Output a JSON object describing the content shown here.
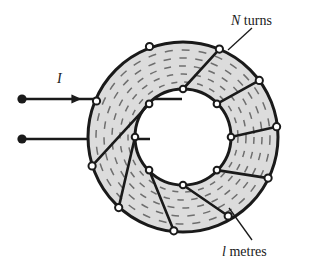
{
  "figure": {
    "type": "toroid-coil-diagram",
    "background_color": "#ffffff",
    "ink_color": "#1a1a1a",
    "core_fill_color": "#dcdcdc",
    "hidden_winding_color": "#6e6e6e",
    "labels": {
      "turns_symbol": "N",
      "turns_text": " turns",
      "length_symbol": "l",
      "length_text": " metres",
      "current_symbol": "I"
    },
    "geometry": {
      "center_x": 183,
      "center_y": 137,
      "outer_radius": 95,
      "inner_radius": 48,
      "turn_count_drawn": 8
    },
    "terminals": {
      "top_terminal_x": 22,
      "top_terminal_y": 99,
      "bottom_terminal_x": 22,
      "bottom_terminal_y": 139
    }
  }
}
